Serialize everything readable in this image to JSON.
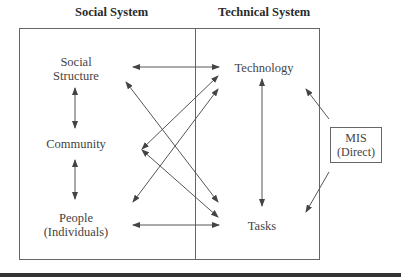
{
  "headers": {
    "social": "Social System",
    "technical": "Technical System"
  },
  "social_nodes": {
    "structure_line1": "Social",
    "structure_line2": "Structure",
    "community": "Community",
    "people_line1": "People",
    "people_line2": "(Individuals)"
  },
  "technical_nodes": {
    "technology": "Technology",
    "tasks": "Tasks"
  },
  "mis": {
    "line1": "MIS",
    "line2": "(Direct)"
  },
  "connections": [
    {
      "from": "Social Structure",
      "to": "Technology",
      "type": "bidirectional"
    },
    {
      "from": "Social Structure",
      "to": "Tasks",
      "type": "bidirectional"
    },
    {
      "from": "Community",
      "to": "Technology",
      "type": "bidirectional"
    },
    {
      "from": "Community",
      "to": "Tasks",
      "type": "bidirectional"
    },
    {
      "from": "People",
      "to": "Technology",
      "type": "bidirectional"
    },
    {
      "from": "People",
      "to": "Tasks",
      "type": "bidirectional"
    },
    {
      "from": "Social Structure",
      "to": "Community",
      "type": "bidirectional"
    },
    {
      "from": "Community",
      "to": "People",
      "type": "bidirectional"
    },
    {
      "from": "Technology",
      "to": "Tasks",
      "type": "bidirectional"
    },
    {
      "from": "MIS",
      "to": "Technology",
      "type": "directed"
    },
    {
      "from": "MIS",
      "to": "Tasks",
      "type": "directed"
    }
  ],
  "colors": {
    "line": "#555555",
    "text": "#444444"
  }
}
